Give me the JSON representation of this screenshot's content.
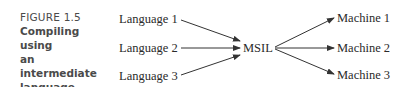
{
  "figure": {
    "number": "FIGURE 1.5",
    "title_line1": "Compiling using",
    "title_line2": "an intermediate",
    "title_line3": "language"
  },
  "diagram": {
    "sources": [
      {
        "label": "Language 1"
      },
      {
        "label": "Language 2"
      },
      {
        "label": "Language 3"
      }
    ],
    "intermediate": {
      "label": "MSIL"
    },
    "targets": [
      {
        "label": "Machine 1"
      },
      {
        "label": "Machine 2"
      },
      {
        "label": "Machine 3"
      }
    ],
    "arrow_color": "#333333"
  }
}
